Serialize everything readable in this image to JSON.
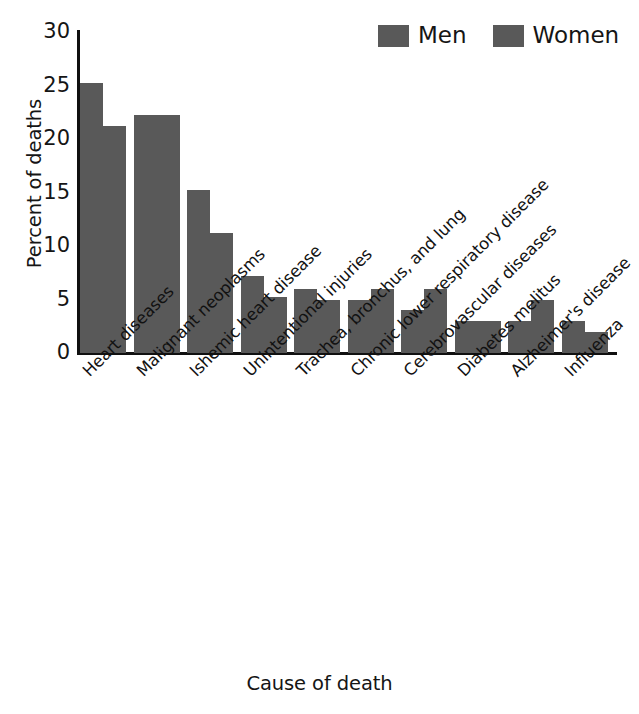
{
  "chart_data": {
    "type": "bar",
    "title": "",
    "xlabel": "Cause of death",
    "ylabel": "Percent of deaths",
    "ylim": [
      0,
      30
    ],
    "yticks": [
      0,
      5,
      10,
      15,
      20,
      25,
      30
    ],
    "ytick_labels": [
      "0",
      "5",
      "10",
      "15",
      "20",
      "25",
      "30"
    ],
    "grid": false,
    "legend_position": "top-right",
    "bar_color": "#595959",
    "categories": [
      "Heart diseases",
      "Malignant neoplasms",
      "Ishemic heart disease",
      "Unintentional injuries",
      "Trachea, bronchus, and lung",
      "Chronic lower respiratory disease",
      "Cerebrovascular diseases",
      "Diabetes melitus",
      "Alzheimer's disease",
      "Influenza"
    ],
    "series": [
      {
        "name": "Men",
        "color": "#595959",
        "values": [
          25.2,
          22.2,
          15.2,
          7.2,
          6,
          5,
          4,
          3,
          3,
          3
        ]
      },
      {
        "name": "Women",
        "color": "#595959",
        "values": [
          21.2,
          22.2,
          11.2,
          5.2,
          5,
          6,
          6,
          3,
          5,
          2
        ]
      }
    ]
  },
  "legend": {
    "entries": [
      {
        "label": "Men",
        "color": "#595959"
      },
      {
        "label": "Women",
        "color": "#595959"
      }
    ]
  },
  "axes": {
    "y_title": "Percent of deaths",
    "x_title": "Cause of death"
  }
}
